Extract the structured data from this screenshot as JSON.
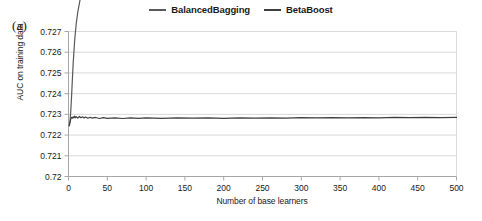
{
  "figure": {
    "panel_letter": "(a)"
  },
  "legend": {
    "position": "top-center",
    "entries": [
      {
        "name": "BalancedBagging",
        "color": "#595959"
      },
      {
        "name": "BetaBoost",
        "color": "#3f3f3f"
      }
    ]
  },
  "axes": {
    "x_title": "Number of base learners",
    "y_title": "AUC on training data",
    "x_ticks": [
      "0",
      "50",
      "100",
      "150",
      "200",
      "250",
      "300",
      "350",
      "400",
      "450",
      "500"
    ],
    "y_ticks": [
      "0.72",
      "0.721",
      "0.722",
      "0.723",
      "0.724",
      "0.725",
      "0.726",
      "0.727"
    ]
  },
  "chart_data": {
    "type": "line",
    "title": "",
    "subtitle": "",
    "xlabel": "Number of base learners",
    "ylabel": "AUC on training data",
    "xlim": [
      0,
      500
    ],
    "ylim": [
      0.72,
      0.727
    ],
    "xticks": [
      0,
      50,
      100,
      150,
      200,
      250,
      300,
      350,
      400,
      450,
      500
    ],
    "yticks": [
      0.72,
      0.721,
      0.722,
      0.723,
      0.724,
      0.725,
      0.726,
      0.727
    ],
    "grid": "horizontal",
    "legend_position": "top-center",
    "annotations": [
      "(a)"
    ],
    "series": [
      {
        "name": "BalancedBagging",
        "color": "#595959",
        "x": [
          1,
          2,
          3,
          4,
          5,
          6,
          8,
          10,
          12,
          15,
          18,
          20,
          25,
          30,
          35,
          40,
          50,
          60,
          70,
          80,
          90,
          100,
          120,
          140,
          160,
          180,
          200,
          220,
          240,
          260,
          280,
          300,
          320,
          340,
          360,
          380,
          400,
          420,
          440,
          460,
          480,
          500
        ],
        "values": [
          0.72245,
          0.7227,
          0.7232,
          0.7239,
          0.7247,
          0.72545,
          0.7266,
          0.7274,
          0.72795,
          0.72855,
          0.72895,
          0.72915,
          0.72955,
          0.72985,
          0.73008,
          0.73027,
          0.73055,
          0.73077,
          0.73094,
          0.73108,
          0.7312,
          0.7313,
          0.73147,
          0.7316,
          0.73171,
          0.7318,
          0.73188,
          0.73196,
          0.73202,
          0.73208,
          0.73213,
          0.73218,
          0.73222,
          0.73226,
          0.7323,
          0.73233,
          0.73236,
          0.73239,
          0.73242,
          0.73245,
          0.73247,
          0.73249
        ]
      },
      {
        "name": "BetaBoost",
        "color": "#3f3f3f",
        "x": [
          1,
          2,
          3,
          4,
          5,
          6,
          7,
          8,
          9,
          10,
          12,
          14,
          16,
          18,
          20,
          22,
          25,
          28,
          30,
          35,
          40,
          45,
          50,
          60,
          70,
          80,
          90,
          100,
          120,
          140,
          160,
          180,
          200,
          220,
          240,
          260,
          280,
          300,
          320,
          340,
          360,
          380,
          400,
          420,
          440,
          460,
          480,
          500
        ],
        "values": [
          0.72245,
          0.72262,
          0.72278,
          0.72286,
          0.72282,
          0.72288,
          0.72283,
          0.72291,
          0.72284,
          0.72289,
          0.72282,
          0.7229,
          0.72284,
          0.72288,
          0.72283,
          0.72287,
          0.72281,
          0.72286,
          0.72282,
          0.72285,
          0.7228,
          0.72284,
          0.72281,
          0.72283,
          0.7228,
          0.72283,
          0.72281,
          0.72283,
          0.72281,
          0.72283,
          0.72282,
          0.72283,
          0.72281,
          0.72283,
          0.72282,
          0.72283,
          0.72282,
          0.72284,
          0.72283,
          0.72284,
          0.72283,
          0.72284,
          0.72283,
          0.72285,
          0.72284,
          0.72285,
          0.72284,
          0.72285
        ]
      }
    ]
  }
}
